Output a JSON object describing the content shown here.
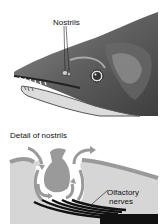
{
  "figure": {
    "top_panel": {
      "label_nostrils": "Nostrils"
    },
    "bottom_panel": {
      "title": "Detail of nostrils",
      "label_nerves_line1": "Olfactory",
      "label_nerves_line2": "nerves"
    },
    "colors": {
      "background": "#ffffff",
      "fish_dark": "#4a4a4a",
      "fish_mid": "#7a7a7a",
      "fish_light": "#b8b8b8",
      "tissue_gray": "#9a9a9a",
      "chamber_light": "#d8d8d8",
      "nerve_black": "#111111"
    }
  }
}
